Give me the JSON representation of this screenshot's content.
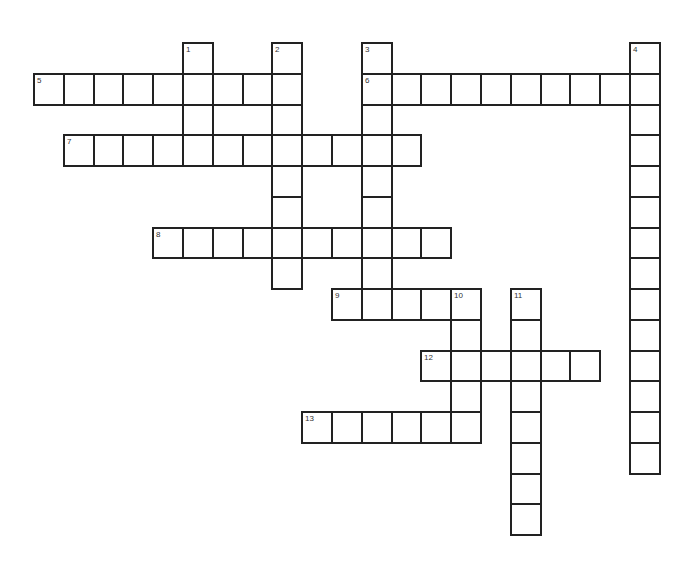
{
  "puzzle": {
    "title": "Crossword",
    "grid": {
      "origin_x": 33,
      "origin_y": 42,
      "cell_w": 29.8,
      "cell_h": 30.75,
      "line_color": "#222222",
      "background": "#ffffff"
    },
    "entries": [
      {
        "number": "1",
        "direction": "down",
        "row": 0,
        "col": 5,
        "length": 4
      },
      {
        "number": "2",
        "direction": "down",
        "row": 0,
        "col": 8,
        "length": 8
      },
      {
        "number": "3",
        "direction": "down",
        "row": 0,
        "col": 11,
        "length": 9
      },
      {
        "number": "4",
        "direction": "down",
        "row": 0,
        "col": 20,
        "length": 14
      },
      {
        "number": "5",
        "direction": "across",
        "row": 1,
        "col": 0,
        "length": 9
      },
      {
        "number": "6",
        "direction": "across",
        "row": 1,
        "col": 11,
        "length": 10
      },
      {
        "number": "7",
        "direction": "across",
        "row": 3,
        "col": 1,
        "length": 12
      },
      {
        "number": "8",
        "direction": "across",
        "row": 6,
        "col": 4,
        "length": 10
      },
      {
        "number": "9",
        "direction": "across",
        "row": 8,
        "col": 10,
        "length": 5
      },
      {
        "number": "10",
        "direction": "down",
        "row": 8,
        "col": 14,
        "length": 5
      },
      {
        "number": "11",
        "direction": "down",
        "row": 8,
        "col": 16,
        "length": 8
      },
      {
        "number": "12",
        "direction": "across",
        "row": 10,
        "col": 13,
        "length": 6
      },
      {
        "number": "13",
        "direction": "across",
        "row": 12,
        "col": 9,
        "length": 6
      }
    ]
  }
}
